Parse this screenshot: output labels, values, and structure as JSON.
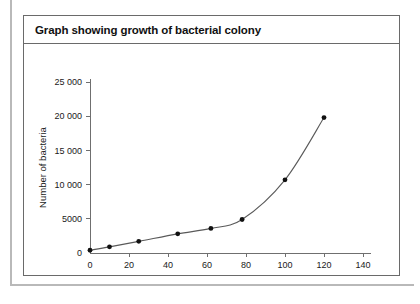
{
  "figure": {
    "title": "Graph showing growth of bacterial colony"
  },
  "chart_data": {
    "type": "line",
    "title": "Graph showing growth of bacterial colony",
    "xlabel": "Time (min)",
    "ylabel": "Number of bacteria",
    "xlim": [
      0,
      140
    ],
    "ylim": [
      0,
      25000
    ],
    "grid": false,
    "legend": null,
    "marker": "filled-circle",
    "xticks": [
      0,
      20,
      40,
      60,
      80,
      100,
      120,
      140
    ],
    "xtick_labels": [
      "0",
      "20",
      "40",
      "60",
      "80",
      "100",
      "120",
      "140"
    ],
    "yticks": [
      0,
      5000,
      10000,
      15000,
      20000,
      25000
    ],
    "ytick_labels": [
      "0",
      "5000",
      "10 000",
      "15 000",
      "20 000",
      "25 000"
    ],
    "x": [
      0,
      10,
      25,
      45,
      62,
      78,
      100,
      120
    ],
    "values": [
      400,
      900,
      1700,
      2800,
      3600,
      4900,
      10700,
      19800
    ],
    "points": [
      {
        "x": 0,
        "y": 400
      },
      {
        "x": 10,
        "y": 900
      },
      {
        "x": 25,
        "y": 1700
      },
      {
        "x": 45,
        "y": 2800
      },
      {
        "x": 62,
        "y": 3600
      },
      {
        "x": 78,
        "y": 4900
      },
      {
        "x": 100,
        "y": 10700
      },
      {
        "x": 120,
        "y": 19800
      }
    ]
  },
  "colors": {
    "curve": "#5a5a5a",
    "marker": "#111111",
    "axis": "#6f6f6f",
    "border": "#6a6a6a",
    "frame": "#b9b9b9"
  }
}
